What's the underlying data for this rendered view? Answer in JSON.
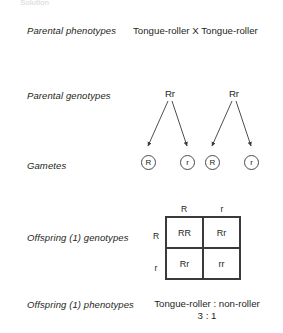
{
  "figure": {
    "clipped_header": "Solution",
    "rows": [
      {
        "label": "Parental phenotypes"
      },
      {
        "label": "Parental genotypes"
      },
      {
        "label": "Gametes"
      },
      {
        "label": "Offspring (1) genotypes"
      },
      {
        "label": "Offspring (1) phenotypes"
      }
    ]
  },
  "parental_phenotypes": {
    "parent1": "Tongue-roller",
    "cross_symbol": "X",
    "parent2": "Tongue-roller",
    "combined": "Tongue-roller  X  Tongue-roller"
  },
  "parental_genotypes": {
    "parent1": "Rr",
    "parent2": "Rr"
  },
  "gametes": {
    "parent1": [
      "R",
      "r"
    ],
    "parent2": [
      "R",
      "r"
    ]
  },
  "punnett": {
    "column_headers": [
      "R",
      "r"
    ],
    "row_headers": [
      "R",
      "r"
    ],
    "cells": [
      [
        "RR",
        "Rr"
      ],
      [
        "Rr",
        "rr"
      ]
    ]
  },
  "offspring_phenotypes": {
    "ratio_labels": "Tongue-roller : non-roller",
    "ratio_values": "3 : 1"
  },
  "style": {
    "ink": "#231f20",
    "line": "#3a3a3a",
    "background": "#ffffff"
  }
}
